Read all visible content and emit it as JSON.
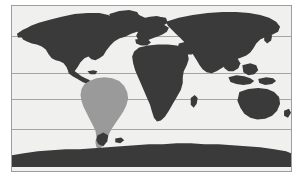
{
  "figure": {
    "kind": "world-map",
    "projection": "equirectangular",
    "background_color": "#ffffff",
    "ocean_color": "#f0f0ee",
    "land_color": "#3a3a3a",
    "highlight_color": "#9a9a9a",
    "border_color": "#9d9d9d",
    "gridline_color": "#9a9a9a",
    "title": "",
    "caption": ""
  },
  "map": {
    "frame": {
      "x": 11,
      "y": 5,
      "width": 281,
      "height": 167
    },
    "gridlines": {
      "orientation": "horizontal",
      "count": 4,
      "y_positions": [
        31,
        68,
        95,
        125
      ]
    },
    "legend": {
      "visible": false,
      "entries": []
    },
    "labels": [],
    "regions": [
      {
        "name": "north-america",
        "shade": "dark",
        "color": "#3a3a3a",
        "highlighted": false
      },
      {
        "name": "south-america",
        "shade": "medium",
        "color": "#9a9a9a",
        "highlighted": true
      },
      {
        "name": "europe",
        "shade": "dark",
        "color": "#3a3a3a",
        "highlighted": false
      },
      {
        "name": "africa",
        "shade": "dark",
        "color": "#3a3a3a",
        "highlighted": false
      },
      {
        "name": "asia",
        "shade": "dark",
        "color": "#3a3a3a",
        "highlighted": false
      },
      {
        "name": "indonesia",
        "shade": "dark",
        "color": "#3a3a3a",
        "highlighted": false
      },
      {
        "name": "australia",
        "shade": "dark",
        "color": "#3a3a3a",
        "highlighted": false
      },
      {
        "name": "antarctica",
        "shade": "dark",
        "color": "#3a3a3a",
        "highlighted": false
      },
      {
        "name": "greenland",
        "shade": "dark",
        "color": "#3a3a3a",
        "highlighted": false
      }
    ]
  }
}
